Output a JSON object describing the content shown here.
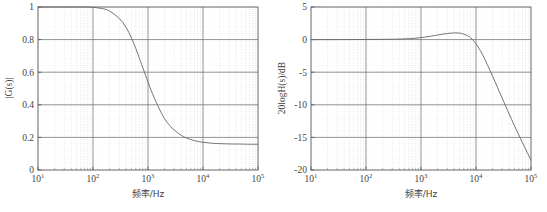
{
  "figure": {
    "background_color": "#ffffff",
    "axis_color": "#555555",
    "major_grid_color": "#6e6e6e",
    "minor_grid_color": "#cfcfcf",
    "curve_color": "#6b6b6b"
  },
  "charts": [
    {
      "id": "magnitude-linear",
      "name": "left-chart",
      "title": "",
      "xlabel": "频率/Hz",
      "ylabel": "|G(s)|",
      "xscale": "log",
      "xlim": [
        10,
        100000
      ],
      "ylim": [
        0,
        1
      ],
      "xticks": [
        "10",
        "10",
        "10",
        "10",
        "10"
      ],
      "xtick_exponents": [
        "1",
        "2",
        "3",
        "4",
        "5"
      ],
      "xtick_values": [
        10,
        100,
        1000,
        10000,
        100000
      ],
      "yticks": [
        "0",
        "0.2",
        "0.4",
        "0.6",
        "0.8",
        "1"
      ],
      "ytick_values": [
        0,
        0.2,
        0.4,
        0.6,
        0.8,
        1
      ],
      "grid": true,
      "minor_grid": true,
      "legend": "none"
    },
    {
      "id": "magnitude-db",
      "name": "right-chart",
      "title": "",
      "xlabel": "频率/Hz",
      "ylabel": "20logH(s)/dB",
      "xscale": "log",
      "xlim": [
        10,
        100000
      ],
      "ylim": [
        -20,
        5
      ],
      "xticks": [
        "10",
        "10",
        "10",
        "10",
        "10"
      ],
      "xtick_exponents": [
        "1",
        "2",
        "3",
        "4",
        "5"
      ],
      "xtick_values": [
        10,
        100,
        1000,
        10000,
        100000
      ],
      "yticks": [
        "5",
        "0",
        "-5",
        "-10",
        "-15",
        "-20"
      ],
      "ytick_values": [
        5,
        0,
        -5,
        -10,
        -15,
        -20
      ],
      "grid": true,
      "minor_grid": true,
      "legend": "none"
    }
  ],
  "chart_data": [
    {
      "type": "line",
      "id": "magnitude-linear",
      "title": "",
      "xlabel": "频率/Hz",
      "ylabel": "|G(s)|",
      "xscale": "log",
      "xlim": [
        10,
        100000
      ],
      "ylim": [
        0,
        1
      ],
      "xticks": [
        10,
        100,
        1000,
        10000,
        100000
      ],
      "xticklabels": [
        "10^1",
        "10^2",
        "10^3",
        "10^4",
        "10^5"
      ],
      "yticks": [
        0,
        0.2,
        0.4,
        0.6,
        0.8,
        1
      ],
      "yticklabels": [
        "0",
        "0.2",
        "0.4",
        "0.6",
        "0.8",
        "1"
      ],
      "grid": true,
      "legend": null,
      "series": [
        {
          "name": "|G(s)|",
          "color": "#6b6b6b",
          "x": [
            10,
            20,
            40,
            70,
            100,
            150,
            200,
            300,
            400,
            500,
            600,
            700,
            800,
            1000,
            1200,
            1500,
            2000,
            2500,
            3000,
            4000,
            5000,
            7000,
            10000,
            15000,
            20000,
            30000,
            50000,
            70000,
            100000
          ],
          "y": [
            1.0,
            1.0,
            1.0,
            1.0,
            0.998,
            0.99,
            0.975,
            0.93,
            0.875,
            0.81,
            0.745,
            0.685,
            0.63,
            0.54,
            0.47,
            0.395,
            0.315,
            0.272,
            0.245,
            0.213,
            0.196,
            0.18,
            0.17,
            0.164,
            0.162,
            0.16,
            0.159,
            0.158,
            0.158
          ]
        }
      ]
    },
    {
      "type": "line",
      "id": "magnitude-db",
      "title": "",
      "xlabel": "频率/Hz",
      "ylabel": "20logH(s)/dB",
      "xscale": "log",
      "xlim": [
        10,
        100000
      ],
      "ylim": [
        -20,
        5
      ],
      "xticks": [
        10,
        100,
        1000,
        10000,
        100000
      ],
      "xticklabels": [
        "10^1",
        "10^2",
        "10^3",
        "10^4",
        "10^5"
      ],
      "yticks": [
        5,
        0,
        -5,
        -10,
        -15,
        -20
      ],
      "yticklabels": [
        "5",
        "0",
        "-5",
        "-10",
        "-15",
        "-20"
      ],
      "grid": true,
      "legend": null,
      "series": [
        {
          "name": "20logH(s)",
          "color": "#6b6b6b",
          "x": [
            10,
            30,
            100,
            300,
            600,
            1000,
            1500,
            2000,
            3000,
            4000,
            5000,
            6000,
            7000,
            8000,
            10000,
            12000,
            15000,
            20000,
            30000,
            40000,
            50000,
            70000,
            100000
          ],
          "y": [
            0.0,
            0.0,
            0.02,
            0.06,
            0.14,
            0.3,
            0.52,
            0.7,
            0.93,
            1.02,
            1.0,
            0.85,
            0.6,
            0.28,
            -0.65,
            -1.7,
            -3.3,
            -5.6,
            -9.0,
            -11.4,
            -13.2,
            -15.8,
            -18.5
          ]
        }
      ]
    }
  ]
}
